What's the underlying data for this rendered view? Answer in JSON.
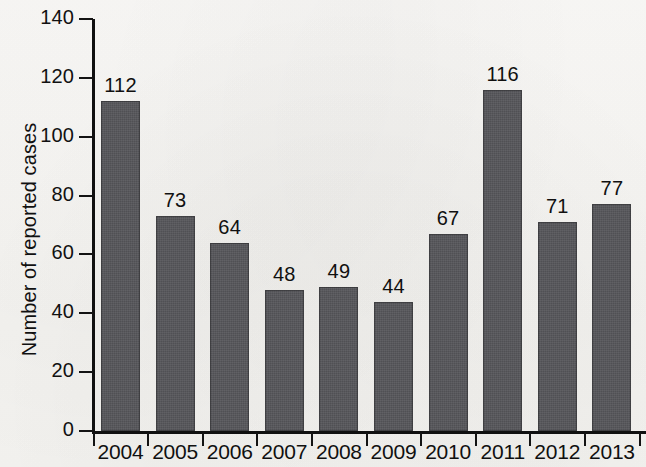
{
  "chart_data": {
    "type": "bar",
    "title": "",
    "subtitle": "",
    "xlabel": "",
    "ylabel": "Number of reported cases",
    "categories": [
      "2004",
      "2005",
      "2006",
      "2007",
      "2008",
      "2009",
      "2010",
      "2011",
      "2012",
      "2013"
    ],
    "values": [
      112,
      73,
      64,
      48,
      49,
      44,
      67,
      116,
      71,
      77
    ],
    "data_labels": [
      "112",
      "73",
      "64",
      "48",
      "49",
      "44",
      "67",
      "116",
      "71",
      "77"
    ],
    "ylim": [
      0,
      140
    ],
    "ytick_values": [
      0,
      20,
      40,
      60,
      80,
      100,
      120,
      140
    ],
    "ytick_labels": [
      "0",
      "20",
      "40",
      "60",
      "80",
      "100",
      "120",
      "140"
    ],
    "grid": false,
    "legend": null,
    "legend_position": "none",
    "bar_color": "#56565a",
    "axis_color": "#101010",
    "background_color": "#f7f6f4",
    "annotations": []
  },
  "figure": {
    "axis_title_y": "Number of reported cases"
  }
}
